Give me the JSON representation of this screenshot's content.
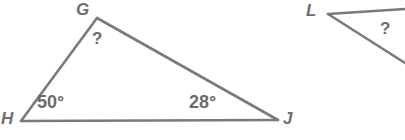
{
  "figure": {
    "background_color": "#ffffff",
    "stroke_color": "#7a7a7c",
    "text_color": "#6b6b6d",
    "width": 405,
    "height": 140
  },
  "triangles": [
    {
      "id": "triangle-GHJ",
      "name": "triangle-ghj",
      "complete": true,
      "vertices": [
        {
          "label": "G",
          "x": 97,
          "y": 18
        },
        {
          "label": "H",
          "x": 21,
          "y": 121
        },
        {
          "label": "J",
          "x": 278,
          "y": 120
        }
      ],
      "angles": [
        {
          "at": "H",
          "value": "50°",
          "known": true
        },
        {
          "at": "J",
          "value": "28°",
          "known": true
        },
        {
          "at": "G",
          "value": "?",
          "known": false
        }
      ]
    },
    {
      "id": "triangle-L",
      "name": "triangle-l-partial",
      "complete": false,
      "vertices": [
        {
          "label": "L",
          "x": 328,
          "y": 14
        }
      ],
      "angles": [
        {
          "at": "L-interior",
          "value": "?",
          "known": false
        }
      ]
    }
  ],
  "labels": {
    "vertex_g": "G",
    "vertex_h": "H",
    "vertex_j": "J",
    "vertex_l": "L",
    "angle_h": "50°",
    "angle_j": "28°",
    "angle_g_unknown": "?",
    "angle_l_unknown": "?"
  }
}
